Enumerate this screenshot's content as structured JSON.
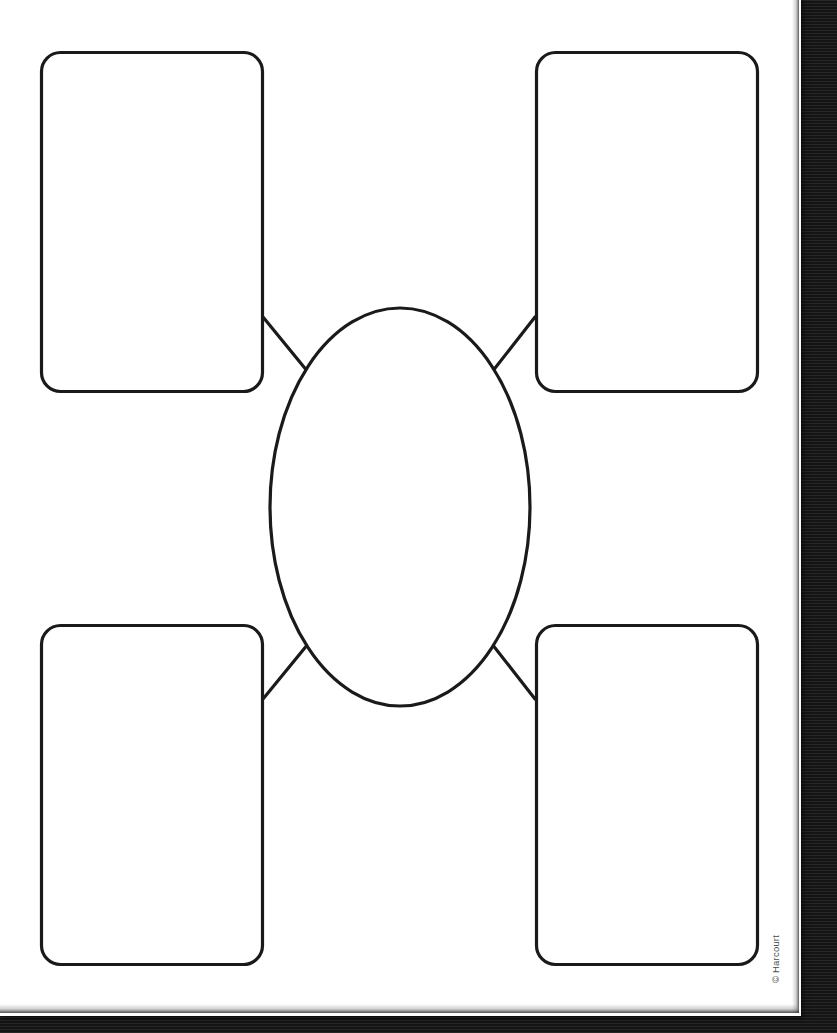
{
  "page": {
    "type": "worksheet",
    "paper_color": "#ffffff",
    "ink_color": "#1a1a1a",
    "scan_background_color": "#1a1a1a",
    "copyright": "© Harcourt"
  },
  "diagram": {
    "kind": "word-web",
    "center_node": {
      "name": "center-oval",
      "shape": "ellipse",
      "label": "",
      "cx": 402,
      "cy": 510,
      "rx": 130,
      "ry": 199
    },
    "nodes": [
      {
        "name": "box-top-left",
        "shape": "rounded-rectangle",
        "label": "",
        "x": 42,
        "y": 54,
        "width": 223,
        "height": 341,
        "radius": 19
      },
      {
        "name": "box-top-right",
        "shape": "rounded-rectangle",
        "label": "",
        "x": 537,
        "y": 54,
        "width": 223,
        "height": 341,
        "radius": 19
      },
      {
        "name": "box-bottom-left",
        "shape": "rounded-rectangle",
        "label": "",
        "x": 42,
        "y": 627,
        "width": 223,
        "height": 341,
        "radius": 19
      },
      {
        "name": "box-bottom-right",
        "shape": "rounded-rectangle",
        "label": "",
        "x": 537,
        "y": 627,
        "width": 223,
        "height": 341,
        "radius": 19
      }
    ],
    "connectors": [
      {
        "name": "connector-top-left",
        "from": "box-top-left",
        "to": "center-oval",
        "x1": 265,
        "y1": 320,
        "x2": 309,
        "y2": 374
      },
      {
        "name": "connector-top-right",
        "from": "box-top-right",
        "to": "center-oval",
        "x1": 537,
        "y1": 320,
        "x2": 495,
        "y2": 374
      },
      {
        "name": "connector-bottom-left",
        "from": "box-bottom-left",
        "to": "center-oval",
        "x1": 265,
        "y1": 702,
        "x2": 309,
        "y2": 648
      },
      {
        "name": "connector-bottom-right",
        "from": "box-bottom-right",
        "to": "center-oval",
        "x1": 537,
        "y1": 702,
        "x2": 495,
        "y2": 648
      }
    ]
  }
}
